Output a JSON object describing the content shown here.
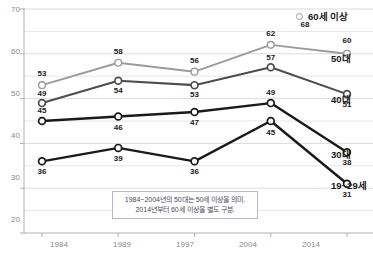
{
  "chart_data": {
    "type": "line",
    "title": "",
    "xlabel": "",
    "ylabel": "",
    "categories": [
      "1984",
      "1989",
      "1997",
      "2004",
      "2014"
    ],
    "ylim": [
      20,
      70
    ],
    "y_ticks": [
      20,
      30,
      40,
      50,
      60,
      70
    ],
    "y_minor_ticks": [
      25,
      35,
      45,
      55,
      65
    ],
    "grid": true,
    "legend_position": "top-right",
    "series": [
      {
        "name": "60세 이상",
        "color": "#9b9b9b",
        "x": [
          "1984",
          "1989",
          "1997",
          "2004",
          "2014"
        ],
        "values": [
          53,
          58,
          56,
          62,
          60
        ],
        "end_label": "50대"
      },
      {
        "name": "50대",
        "color": "#4d4d4d",
        "x": [
          "1984",
          "1989",
          "1997",
          "2004",
          "2014"
        ],
        "values": [
          49,
          54,
          53,
          57,
          51
        ],
        "end_label": "40대"
      },
      {
        "name": "40대",
        "color": "#1a1a1a",
        "x": [
          "1984",
          "1989",
          "1997",
          "2004",
          "2014"
        ],
        "values": [
          45,
          46,
          47,
          49,
          38
        ],
        "end_label": "30대"
      },
      {
        "name": "30대",
        "color": "#1a1a1a",
        "x": [
          "1984",
          "1989",
          "1997",
          "2004",
          "2014"
        ],
        "values": [
          36,
          39,
          36,
          45,
          31
        ],
        "end_label": "19~29세"
      }
    ],
    "legend_value_label": "68",
    "annotations": [
      "1984~2004년의 50대는 50세 이상을 의미.",
      "2014년부터 60세 이상을 별도 구분."
    ]
  },
  "legend": {
    "marker_name": "open-circle-marker",
    "label": "60세 이상",
    "value": "68"
  },
  "series_end_labels": {
    "s0": "50대",
    "s1": "40대",
    "s2": "30대",
    "s3": "19~29세"
  },
  "axis": {
    "y_ticks": [
      "70",
      "60",
      "50",
      "40",
      "30",
      "20"
    ],
    "x_ticks": [
      "1984",
      "1989",
      "1997",
      "2004",
      "2014"
    ]
  },
  "note": {
    "line1": "1984~2004년의 50대는 50세 이상을 의미.",
    "line2": "2014년부터 60세 이상을 별도 구분."
  },
  "point_labels": {
    "s0": [
      "53",
      "58",
      "56",
      "62",
      "60"
    ],
    "s1": [
      "49",
      "54",
      "53",
      "57",
      "51"
    ],
    "s2": [
      "45",
      "46",
      "47",
      "49",
      "38"
    ],
    "s3": [
      "36",
      "39",
      "36",
      "45",
      "31"
    ]
  }
}
